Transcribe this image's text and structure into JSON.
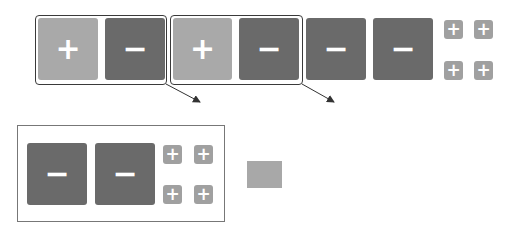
{
  "colors": {
    "light_tile": "#a9a9a9",
    "dark_tile": "#6a6a6a",
    "mini_tile": "#a0a0a0",
    "border": "#3a3a3a",
    "swatch": "#a8a8a8"
  },
  "top_row": {
    "groups": [
      {
        "tiles": [
          {
            "type": "light",
            "symbol": "+"
          },
          {
            "type": "dark",
            "symbol": "−"
          }
        ]
      },
      {
        "tiles": [
          {
            "type": "light",
            "symbol": "+"
          },
          {
            "type": "dark",
            "symbol": "−"
          }
        ]
      }
    ],
    "loose_tiles": [
      {
        "type": "dark",
        "symbol": "−"
      },
      {
        "type": "dark",
        "symbol": "−"
      }
    ],
    "mini_tiles": [
      "+",
      "+",
      "+",
      "+"
    ]
  },
  "bottom_box": {
    "tiles": [
      {
        "type": "dark",
        "symbol": "−"
      },
      {
        "type": "dark",
        "symbol": "−"
      }
    ],
    "mini_tiles": [
      "+",
      "+",
      "+",
      "+"
    ]
  }
}
